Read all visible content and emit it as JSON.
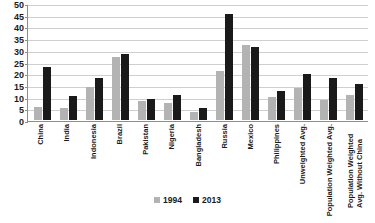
{
  "chart_data": {
    "type": "bar",
    "title": "",
    "subtitle": "",
    "xlabel": "",
    "ylabel": "",
    "ylim": [
      0,
      50
    ],
    "yticks": [
      0,
      5,
      10,
      15,
      20,
      25,
      30,
      35,
      40,
      45,
      50
    ],
    "grid": true,
    "legend_position": "bottom-center",
    "categories": [
      "China",
      "India",
      "Indonesia",
      "Brazil",
      "Pakistan",
      "Nigeria",
      "Bangladesh",
      "Russia",
      "Mexico",
      "Philippines",
      "Unweighted Avg.",
      "Population Weighted Avg.",
      "Population Weighted Avg. Without China"
    ],
    "series": [
      {
        "name": "1994",
        "color": "#b3b3b3",
        "values": [
          5.5,
          5.0,
          14.0,
          27.0,
          8.2,
          7.2,
          3.3,
          21.0,
          32.0,
          10.0,
          13.5,
          8.7,
          10.5
        ]
      },
      {
        "name": "2013",
        "color": "#1a1a1a",
        "values": [
          22.5,
          10.3,
          18.0,
          28.3,
          9.0,
          10.6,
          5.0,
          45.5,
          31.2,
          12.5,
          19.5,
          17.8,
          15.3
        ]
      }
    ]
  },
  "axis": {
    "y_tick_labels": [
      "0",
      "5",
      "10",
      "15",
      "20",
      "25",
      "30",
      "35",
      "40",
      "45",
      "50"
    ]
  },
  "legend": {
    "items": [
      {
        "label": "1994",
        "color": "#b3b3b3"
      },
      {
        "label": "2013",
        "color": "#1a1a1a"
      }
    ]
  },
  "colors": {
    "series_1994": "#b3b3b3",
    "series_2013": "#1a1a1a",
    "gridline": "#cfcfcf",
    "axis": "#8d8d8d",
    "background": "#ffffff"
  }
}
